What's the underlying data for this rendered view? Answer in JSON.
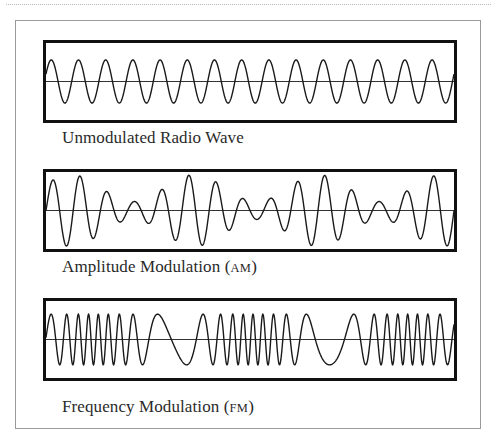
{
  "figure": {
    "panels": [
      {
        "id": "unmodulated",
        "caption": "Unmodulated Radio Wave",
        "caption_abbrev": "",
        "signal": {
          "type": "carrier",
          "carrier_cycles": 15.0,
          "amplitude": 0.56,
          "phase_start_deg": 20
        }
      },
      {
        "id": "am",
        "caption": "Amplitude Modulation",
        "caption_abbrev": "AM",
        "signal": {
          "type": "am",
          "carrier_cycles": 15.0,
          "amplitude": 0.6,
          "modulation_cycles": 3.3,
          "modulation_depth": 0.6,
          "phase_start_deg": 0
        }
      },
      {
        "id": "fm",
        "caption": "Frequency Modulation",
        "caption_abbrev": "FM",
        "signal": {
          "type": "fm",
          "carrier_cycles": 24.0,
          "amplitude": 0.47,
          "modulation_cycles": 2.6,
          "frequency_deviation": 0.75,
          "phase_start_deg": 0
        }
      }
    ],
    "colors": {
      "wave": "#1a1a1a",
      "axis": "#333333",
      "box": "#111111",
      "frame": "#9a9a9a"
    }
  }
}
